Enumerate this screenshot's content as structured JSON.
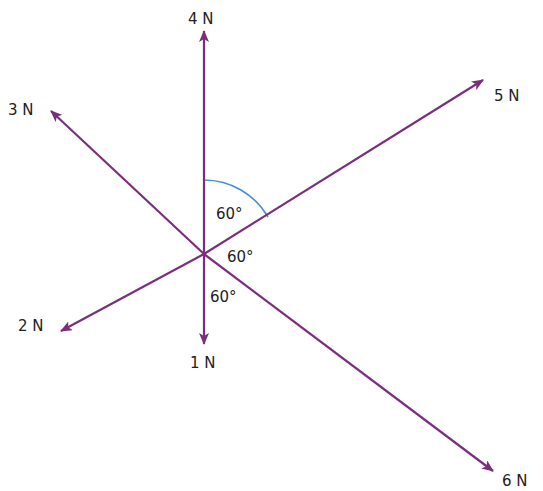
{
  "title_fragment": "g",
  "colors": {
    "arrow": "#7a2f7c",
    "arc": "#4a8fd6",
    "text": "#222222"
  },
  "center": {
    "x": 204,
    "y": 254
  },
  "forces": [
    {
      "label": "4 N",
      "tip": [
        204,
        30
      ],
      "label_pos": [
        188,
        24
      ]
    },
    {
      "label": "5 N",
      "tip": [
        484,
        79
      ],
      "label_pos": [
        494,
        101
      ]
    },
    {
      "label": "3 N",
      "tip": [
        50,
        110
      ],
      "label_pos": [
        8,
        115
      ]
    },
    {
      "label": "2 N",
      "tip": [
        60,
        332
      ],
      "label_pos": [
        18,
        331
      ]
    },
    {
      "label": "1 N",
      "tip": [
        204,
        345
      ],
      "label_pos": [
        190,
        368
      ]
    },
    {
      "label": "6 N",
      "tip": [
        494,
        472
      ],
      "label_pos": [
        502,
        486
      ]
    }
  ],
  "angles": [
    {
      "label": "60°",
      "pos": [
        216,
        219
      ]
    },
    {
      "label": "60°",
      "pos": [
        227,
        262
      ]
    },
    {
      "label": "60°",
      "pos": [
        210,
        302
      ]
    }
  ]
}
